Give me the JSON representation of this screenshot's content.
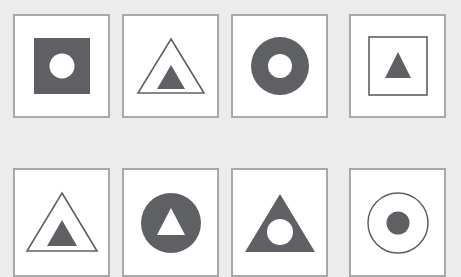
{
  "canvas": {
    "width": 461,
    "height": 277,
    "background_color": "#ececed",
    "cell_background_color": "#ffffff",
    "cell_border_color": "#a8a8ab",
    "shape_fill_color": "#5f6063",
    "shape_stroke_color": "#5f6063",
    "hole_color": "#ffffff"
  },
  "layout": {
    "columns": 4,
    "rows": 2,
    "cell_width": 97,
    "cell_height": 104,
    "col_x": [
      13,
      122,
      231,
      349
    ],
    "row_y": [
      14,
      168
    ],
    "row_heights": [
      104,
      109
    ]
  },
  "grid": {
    "cells": [
      {
        "index": 1,
        "position": "row1-col1",
        "outer_shape": "square",
        "outer_style": "filled",
        "inner_shape": "circle",
        "inner_style": "hole",
        "description": "filled square with white circle hole"
      },
      {
        "index": 2,
        "position": "row1-col2",
        "outer_shape": "triangle",
        "outer_style": "outline",
        "inner_shape": "triangle",
        "inner_style": "filled",
        "description": "outlined triangle with small filled triangle"
      },
      {
        "index": 3,
        "position": "row1-col3",
        "outer_shape": "circle",
        "outer_style": "filled",
        "inner_shape": "circle",
        "inner_style": "hole",
        "description": "filled circle with white circle hole"
      },
      {
        "index": 4,
        "position": "row1-col4",
        "outer_shape": "square",
        "outer_style": "outline",
        "inner_shape": "triangle",
        "inner_style": "filled",
        "description": "outlined square with small filled triangle"
      },
      {
        "index": 5,
        "position": "row2-col1",
        "outer_shape": "triangle",
        "outer_style": "outline",
        "inner_shape": "triangle",
        "inner_style": "filled",
        "description": "outlined triangle with small filled triangle"
      },
      {
        "index": 6,
        "position": "row2-col2",
        "outer_shape": "circle",
        "outer_style": "filled",
        "inner_shape": "triangle",
        "inner_style": "hole",
        "description": "filled circle with white triangle hole"
      },
      {
        "index": 7,
        "position": "row2-col3",
        "outer_shape": "triangle",
        "outer_style": "filled",
        "inner_shape": "circle",
        "inner_style": "hole",
        "description": "filled triangle with white circle hole"
      },
      {
        "index": 8,
        "position": "row2-col4",
        "outer_shape": "circle",
        "outer_style": "outline",
        "inner_shape": "circle",
        "inner_style": "filled",
        "description": "outlined circle with small filled circle"
      }
    ]
  }
}
